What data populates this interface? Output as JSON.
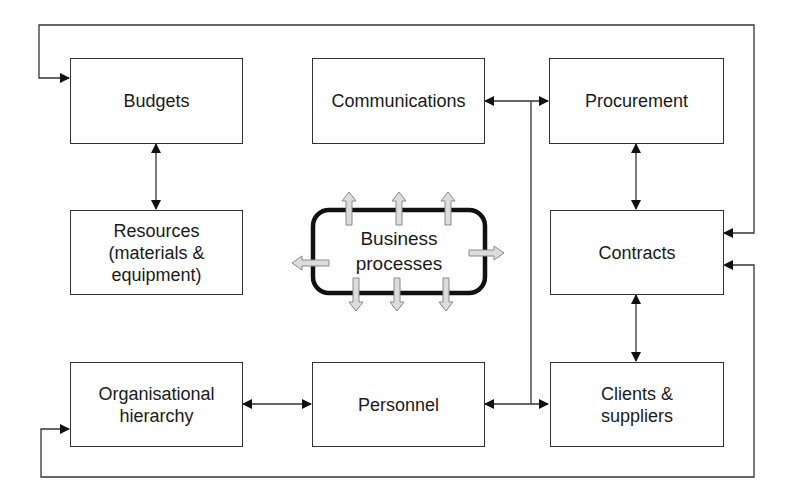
{
  "diagram": {
    "colors": {
      "line": "#333333",
      "text": "#1a1a1a",
      "bp_border": "#111111",
      "bp_arrow_fill": "#d8d8d8",
      "bp_arrow_stroke": "#888888",
      "background": "#ffffff"
    },
    "nodes": {
      "budgets": {
        "label": "Budgets"
      },
      "communications": {
        "label": "Communications"
      },
      "procurement": {
        "label": "Procurement"
      },
      "resources": {
        "label": "Resources\n(materials &\nequipment)"
      },
      "contracts": {
        "label": "Contracts"
      },
      "organisational_hierarchy": {
        "label": "Organisational\nhierarchy"
      },
      "personnel": {
        "label": "Personnel"
      },
      "clients_suppliers": {
        "label": "Clients &\nsuppliers"
      }
    },
    "center": {
      "label": "Business\nprocesses"
    },
    "edges": [
      {
        "from": "Budgets",
        "to": "Resources (materials & equipment)",
        "type": "bidirectional"
      },
      {
        "from": "Procurement",
        "to": "Contracts",
        "type": "bidirectional"
      },
      {
        "from": "Contracts",
        "to": "Clients & suppliers",
        "type": "bidirectional"
      },
      {
        "from": "Organisational hierarchy",
        "to": "Personnel",
        "type": "bidirectional"
      },
      {
        "from": "Communications",
        "to": "Procurement",
        "type": "bidirectional-bus"
      },
      {
        "from": "Personnel",
        "to": "Clients & suppliers",
        "type": "bidirectional-bus"
      },
      {
        "from": "Contracts",
        "to": "Budgets",
        "type": "loop-top"
      },
      {
        "from": "Contracts",
        "to": "Organisational hierarchy",
        "type": "loop-bottom"
      }
    ]
  }
}
